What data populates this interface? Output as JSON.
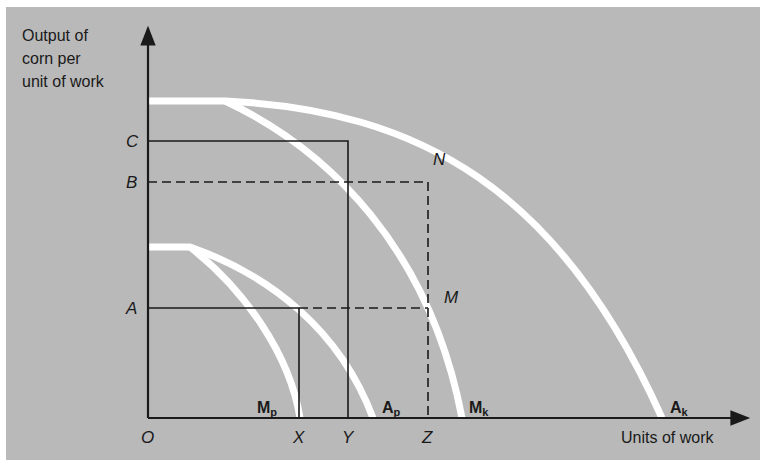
{
  "diagram": {
    "colors": {
      "background": "#b9b9b9",
      "curves": "#ffffff",
      "lines": "#1a1a1a"
    },
    "y_axis_title": [
      "Output of",
      "corn per",
      "unit of work"
    ],
    "x_axis_title": "Units of work",
    "origin_label": "O",
    "y_labels": {
      "C": "C",
      "B": "B",
      "A": "A"
    },
    "x_labels": {
      "X": "X",
      "Y": "Y",
      "Z": "Z"
    },
    "point_labels": {
      "N": "N",
      "M": "M"
    },
    "curves": [
      {
        "main": "M",
        "sub": "p"
      },
      {
        "main": "A",
        "sub": "p"
      },
      {
        "main": "M",
        "sub": "k"
      },
      {
        "main": "A",
        "sub": "k"
      }
    ]
  }
}
